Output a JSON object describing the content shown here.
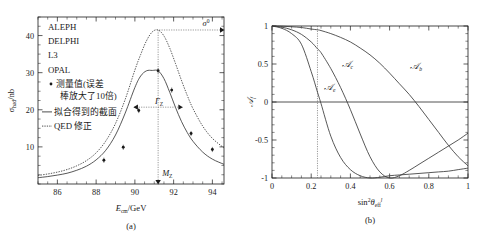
{
  "figure": {
    "panel_a_caption": "(a)",
    "panel_b_caption": "(b)"
  },
  "chart_data": [
    {
      "type": "line",
      "panel": "a",
      "title": "",
      "xlabel": "E_cm / GeV",
      "xlabel_main": "E",
      "xlabel_sub": "cm",
      "xlabel_unit": "/GeV",
      "ylabel": "σ_had / nb",
      "ylabel_main": "σ",
      "ylabel_sub": "had",
      "ylabel_unit": "/nb",
      "xlim": [
        85,
        94.6
      ],
      "ylim": [
        0,
        45
      ],
      "xticks": [
        86,
        88,
        90,
        92,
        94
      ],
      "yticks": [
        10,
        20,
        30,
        40
      ],
      "grid": false,
      "legend_position": "upper-left",
      "legend": [
        {
          "label": "ALEPH",
          "marker": "none"
        },
        {
          "label": "DELPHI",
          "marker": "none"
        },
        {
          "label": "L3",
          "marker": "none"
        },
        {
          "label": "OPAL",
          "marker": "none"
        },
        {
          "label": "测量值(误差",
          "label2": "棒放大了10倍)",
          "marker": "point"
        },
        {
          "label": "拟合得到的截面",
          "marker": "solid-line"
        },
        {
          "label": "QED 修正",
          "marker": "dotted-line"
        }
      ],
      "annotations": [
        {
          "text": "σ⁰",
          "text_main": "σ",
          "text_sup": "0",
          "kind": "peak-arrow",
          "value": 41.5
        },
        {
          "text": "Γ_Z",
          "text_main": "Γ",
          "text_sub": "Z",
          "kind": "width-arrow",
          "value": 2.5
        },
        {
          "text": "M_Z",
          "text_main": "M",
          "text_sub": "Z",
          "kind": "mass-arrow",
          "value": 91.2
        }
      ],
      "series": [
        {
          "name": "QED 修正",
          "style": "dotted",
          "x": [
            85.0,
            85.5,
            86.0,
            86.5,
            87.0,
            87.5,
            88.0,
            88.5,
            89.0,
            89.5,
            90.0,
            90.3,
            90.6,
            90.9,
            91.2,
            91.5,
            91.8,
            92.1,
            92.4,
            92.7,
            93.0,
            93.5,
            94.0,
            94.6
          ],
          "y": [
            2.3,
            2.7,
            3.2,
            3.9,
            4.9,
            6.3,
            8.4,
            11.6,
            16.3,
            22.8,
            30.7,
            34.9,
            38.6,
            41.0,
            41.5,
            39.9,
            36.6,
            32.4,
            28.0,
            23.9,
            20.3,
            15.6,
            12.3,
            9.7
          ]
        },
        {
          "name": "拟合得到的截面",
          "style": "solid",
          "x": [
            85.0,
            85.5,
            86.0,
            86.5,
            87.0,
            87.5,
            88.0,
            88.5,
            89.0,
            89.5,
            90.0,
            90.3,
            90.6,
            90.9,
            91.2,
            91.5,
            91.8,
            92.1,
            92.4,
            92.7,
            93.0,
            93.5,
            94.0,
            94.6
          ],
          "y": [
            1.7,
            2.0,
            2.4,
            2.9,
            3.7,
            4.8,
            6.5,
            9.1,
            13.2,
            19.1,
            26.0,
            29.1,
            30.5,
            30.6,
            30.5,
            28.4,
            24.7,
            20.6,
            16.9,
            13.9,
            11.5,
            8.6,
            6.7,
            5.3
          ]
        }
      ],
      "data_points": {
        "name": "测量值",
        "x": [
          88.4,
          89.4,
          90.2,
          91.2,
          91.9,
          92.9,
          94.0
        ],
        "y": [
          6.4,
          9.9,
          19.8,
          30.5,
          25.3,
          13.6,
          9.3
        ]
      }
    },
    {
      "type": "line",
      "panel": "b",
      "title": "",
      "xlabel": "sin²θ_eff^l",
      "xlabel_main": "sin",
      "xlabel_sup": "2",
      "xlabel_theta": "θ",
      "xlabel_sub": "eff",
      "xlabel_supr": "l",
      "ylabel": "A_f",
      "ylabel_main": "𝒜",
      "ylabel_sub": "f",
      "xlim": [
        0,
        1
      ],
      "ylim": [
        -1,
        1
      ],
      "xticks": [
        0,
        0.2,
        0.4,
        0.6,
        0.8,
        1
      ],
      "xtick_labels": [
        "0",
        "0.2",
        "0.4",
        "0.6",
        "0.8",
        "1"
      ],
      "yticks": [
        -1,
        -0.5,
        0,
        0.5,
        1
      ],
      "ytick_labels": [
        "-1",
        "-0.5",
        "0",
        "0.5",
        "1"
      ],
      "grid": false,
      "legend_position": "inline-labels",
      "guides": [
        {
          "kind": "vline",
          "x": 0.232
        }
      ],
      "series": [
        {
          "name": "𝒜_e",
          "label_main": "𝒜",
          "label_sub": "e",
          "label_x": 0.265,
          "label_y": 0.16,
          "style": "solid",
          "x": [
            0,
            0.05,
            0.1,
            0.15,
            0.2,
            0.232,
            0.25,
            0.3,
            0.35,
            0.4,
            0.45,
            0.5,
            0.55,
            0.6,
            0.65,
            0.7,
            0.75,
            0.8,
            0.85,
            0.9,
            0.95,
            1.0
          ],
          "y": [
            1.0,
            0.97,
            0.9,
            0.76,
            0.4,
            0.13,
            -0.02,
            -0.45,
            -0.73,
            -0.89,
            -0.97,
            -1.0,
            -0.99,
            -0.97,
            -0.96,
            -0.95,
            -0.94,
            -0.93,
            -0.92,
            -0.91,
            -0.89,
            -0.87
          ]
        },
        {
          "name": "𝒜_c",
          "label_main": "𝒜",
          "label_sub": "c",
          "label_x": 0.355,
          "label_y": 0.46,
          "style": "solid",
          "x": [
            0,
            0.05,
            0.1,
            0.15,
            0.2,
            0.232,
            0.25,
            0.3,
            0.35,
            0.4,
            0.45,
            0.5,
            0.55,
            0.6,
            0.65,
            0.7,
            0.75,
            0.8,
            0.85,
            0.9,
            0.95,
            1.0
          ],
          "y": [
            1.0,
            0.985,
            0.95,
            0.89,
            0.79,
            0.7,
            0.65,
            0.44,
            0.19,
            -0.1,
            -0.42,
            -0.72,
            -0.92,
            -1.0,
            -0.97,
            -0.9,
            -0.82,
            -0.74,
            -0.66,
            -0.58,
            -0.5,
            -0.41
          ]
        },
        {
          "name": "𝒜_b",
          "label_main": "𝒜",
          "label_sub": "b",
          "label_x": 0.705,
          "label_y": 0.44,
          "style": "solid",
          "x": [
            0,
            0.05,
            0.1,
            0.15,
            0.2,
            0.232,
            0.25,
            0.3,
            0.35,
            0.4,
            0.45,
            0.5,
            0.55,
            0.6,
            0.65,
            0.7,
            0.75,
            0.8,
            0.85,
            0.9,
            0.95,
            1.0
          ],
          "y": [
            1.0,
            0.998,
            0.99,
            0.98,
            0.96,
            0.95,
            0.94,
            0.9,
            0.85,
            0.79,
            0.71,
            0.62,
            0.51,
            0.38,
            0.24,
            0.1,
            -0.06,
            -0.23,
            -0.4,
            -0.57,
            -0.72,
            -0.84
          ]
        }
      ]
    }
  ]
}
